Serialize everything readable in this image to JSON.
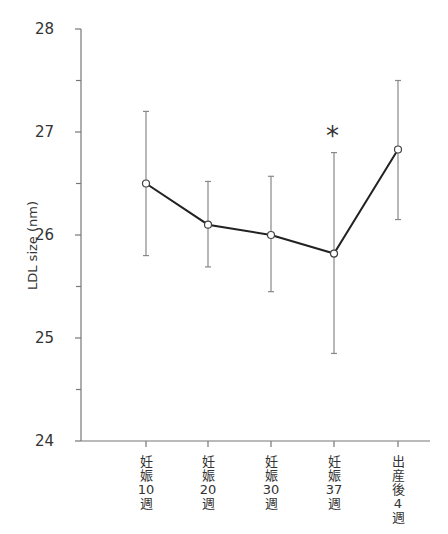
{
  "chart_data": {
    "type": "line",
    "title": "",
    "xlabel": "",
    "ylabel": "LDL size (nm)",
    "ylim": [
      24,
      28
    ],
    "yticks": [
      24,
      25,
      26,
      27,
      28
    ],
    "minor_yticks": [
      24.5,
      25.5,
      26.5,
      27.5
    ],
    "grid": false,
    "categories": [
      "妊娠10週",
      "妊娠20週",
      "妊娠30週",
      "妊娠37週",
      "出産後4週"
    ],
    "category_lines": [
      [
        "妊",
        "娠",
        "10",
        "週"
      ],
      [
        "妊",
        "娠",
        "20",
        "週"
      ],
      [
        "妊",
        "娠",
        "30",
        "週"
      ],
      [
        "妊",
        "娠",
        "37",
        "週"
      ],
      [
        "出",
        "産",
        "後",
        "4",
        "週"
      ]
    ],
    "series": [
      {
        "name": "LDL size",
        "values": [
          26.5,
          26.1,
          26.0,
          25.82,
          26.83
        ],
        "error_upper": [
          27.2,
          26.52,
          26.57,
          26.8,
          27.5
        ],
        "error_lower": [
          25.8,
          25.69,
          25.45,
          24.85,
          26.15
        ]
      }
    ],
    "annotations": [
      {
        "text": "*",
        "category_index": 3,
        "y": 27.02,
        "meaning": "significant difference"
      }
    ]
  },
  "labels": {
    "ylabel": "LDL size (nm)",
    "yticks": [
      "24",
      "25",
      "26",
      "27",
      "28"
    ],
    "asterisk": "*"
  }
}
